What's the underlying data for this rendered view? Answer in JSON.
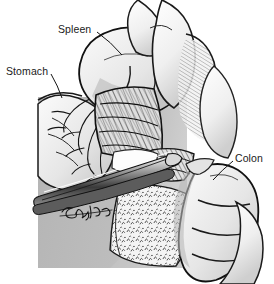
{
  "figure": {
    "kind": "medical-illustration",
    "style": "pen-and-ink line drawing with halftone shading",
    "background_panel_color": "#b9b9b9",
    "ink_color": "#1a1a1a",
    "paper_color": "#ffffff"
  },
  "labels": [
    {
      "id": "spleen",
      "text": "Spleen",
      "x": 58,
      "y": 23,
      "leader": {
        "from_x": 97,
        "from_y": 32,
        "to_x": 122,
        "to_y": 55
      }
    },
    {
      "id": "stomach",
      "text": "Stomach",
      "x": 6,
      "y": 65,
      "leader": {
        "from_x": 51,
        "from_y": 74,
        "to_x": 62,
        "to_y": 98
      }
    },
    {
      "id": "colon",
      "text": "Colon",
      "x": 235,
      "y": 152,
      "leader": {
        "from_x": 233,
        "from_y": 161,
        "to_x": 213,
        "to_y": 180
      }
    }
  ],
  "structures": [
    {
      "name": "spleen",
      "description": "large lobed organ upper centre-left, retracted superiorly"
    },
    {
      "name": "stomach",
      "description": "greater curvature entering from the left with short gastric vessels"
    },
    {
      "name": "gastrosplenic-ligament",
      "description": "densely hatched band of short gastric vessels between stomach and spleen"
    },
    {
      "name": "colon",
      "description": "haustrated tubular bowel at the right, splenic flexure"
    },
    {
      "name": "omentum",
      "description": "stippled fatty apron draping inferiorly below the clamp"
    },
    {
      "name": "surgical-clamp",
      "description": "long slender instrument crossing the field from lower-left"
    }
  ],
  "signature": {
    "text": "artist signature",
    "x": 62,
    "y": 208
  }
}
